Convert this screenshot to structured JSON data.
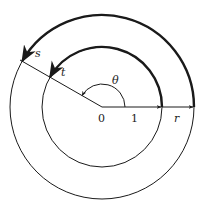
{
  "figure": {
    "center": {
      "x": 102,
      "y": 107
    },
    "inner_radius": 60,
    "outer_radius": 92,
    "angle_deg": 150,
    "stroke_color": "#1a1a1a",
    "background": "#ffffff"
  },
  "labels": {
    "origin": "0",
    "unit": "1",
    "radius": "r",
    "theta": "θ",
    "inner_point": "t",
    "outer_point": "s"
  }
}
